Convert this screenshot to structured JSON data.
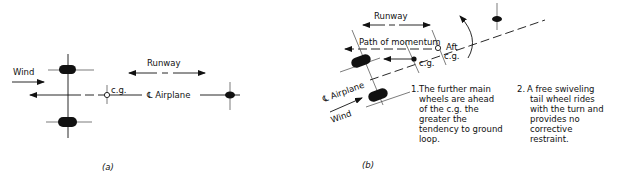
{
  "panel_a": {
    "caption": "(a)",
    "labels": {
      "wind": "Wind",
      "runway": "Runway",
      "cg": "c.g.",
      "centerline": "℄ Airplane"
    }
  },
  "panel_b": {
    "caption": "(b)",
    "labels": {
      "runway": "Runway",
      "path_of_momentum": "Path of momentum",
      "aft": "Aft",
      "aft_cg": "c.g.",
      "cg": "c.g.",
      "centerline": "℄ Airplane",
      "wind": "Wind"
    },
    "notes": [
      {
        "number": "1.",
        "lines": [
          "The further main",
          "wheels are ahead",
          "of the c.g. the",
          "greater the",
          "tendency to ground",
          "loop."
        ]
      },
      {
        "number": "2.",
        "lines": [
          "A free swiveling",
          "tail wheel rides",
          "with the turn and",
          "provides no",
          "corrective",
          "restraint."
        ]
      }
    ]
  }
}
